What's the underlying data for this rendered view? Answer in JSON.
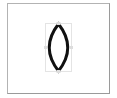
{
  "canvas": {
    "background": "#ffffff",
    "frame_color": "#b3b3b3"
  },
  "shape": {
    "type": "lens",
    "icon": "lens-shape-icon",
    "stroke_color": "#111111",
    "selected": true,
    "selection_box_color": "#c8c8c8"
  }
}
